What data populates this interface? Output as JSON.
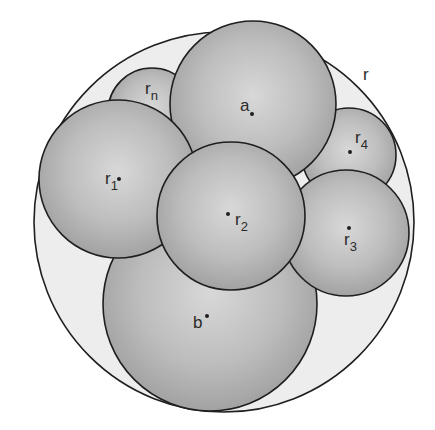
{
  "diagram": {
    "title": "",
    "outer_circle": {
      "id": "r",
      "label": "r",
      "cx": 224,
      "cy": 222,
      "r": 190,
      "fill": "#ededed",
      "label_x": 363,
      "label_y": 80
    },
    "circles": [
      {
        "id": "rn",
        "label_main": "r",
        "label_sub": "n",
        "cx": 152,
        "cy": 112,
        "r": 44,
        "label_x": 145,
        "label_y": 94,
        "dot": false,
        "dot_x": 0,
        "dot_y": 0
      },
      {
        "id": "r4",
        "label_main": "r",
        "label_sub": "4",
        "cx": 349,
        "cy": 155,
        "r": 47,
        "label_x": 355,
        "label_y": 143,
        "dot": true,
        "dot_x": 350,
        "dot_y": 152
      },
      {
        "id": "a",
        "label_main": "a",
        "label_sub": "",
        "cx": 253,
        "cy": 104,
        "r": 83,
        "label_x": 240,
        "label_y": 111,
        "dot": true,
        "dot_x": 252,
        "dot_y": 114
      },
      {
        "id": "b",
        "label_main": "b",
        "label_sub": "",
        "cx": 210,
        "cy": 304,
        "r": 107,
        "label_x": 193,
        "label_y": 328,
        "dot": true,
        "dot_x": 207,
        "dot_y": 316
      },
      {
        "id": "r1",
        "label_main": "r",
        "label_sub": "1",
        "cx": 118,
        "cy": 179,
        "r": 79,
        "label_x": 105,
        "label_y": 184,
        "dot": true,
        "dot_x": 119,
        "dot_y": 179
      },
      {
        "id": "r3",
        "label_main": "r",
        "label_sub": "3",
        "cx": 346,
        "cy": 233,
        "r": 63,
        "label_x": 344,
        "label_y": 245,
        "dot": true,
        "dot_x": 349,
        "dot_y": 228
      },
      {
        "id": "r2",
        "label_main": "r",
        "label_sub": "2",
        "cx": 231,
        "cy": 216,
        "r": 74,
        "label_x": 235,
        "label_y": 225,
        "dot": true,
        "dot_x": 228,
        "dot_y": 214
      }
    ],
    "colors": {
      "background": "#ffffff",
      "outer_fill": "#ededed",
      "sphere_highlight": "#dcdcdc",
      "sphere_mid": "#b9b9b9",
      "sphere_edge": "#9a9a9a",
      "stroke": "#1f1f1f",
      "text": "#2a2a2a"
    }
  }
}
